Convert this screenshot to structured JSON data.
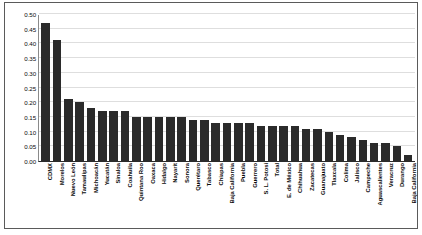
{
  "chart_data": {
    "type": "bar",
    "title": "",
    "subtitle": "",
    "xlabel": "",
    "ylabel": "",
    "ylim": [
      0.0,
      0.5
    ],
    "grid": true,
    "legend": null,
    "bar_color": "#2b2b2b",
    "background_color": "#ffffff",
    "gridline_color": "#dedede",
    "axis_color": "#2b2b2b",
    "ytick_labels": [
      "0.50",
      "0.45",
      "0.40",
      "0.35",
      "0.30",
      "0.25",
      "0.20",
      "0.15",
      "0.10",
      "0.05",
      "0.00"
    ],
    "ytick_values": [
      0.5,
      0.45,
      0.4,
      0.35,
      0.3,
      0.25,
      0.2,
      0.15,
      0.1,
      0.05,
      0.0
    ],
    "categories": [
      "CDMX",
      "Morelos",
      "Nuevo León",
      "Tamaulipas",
      "Michoacán",
      "Yucatán",
      "Sinaloa",
      "Coahuila",
      "Quintana Roo",
      "Oaxaca",
      "Hidalgo",
      "Nayarit",
      "Sonora",
      "Querétaro",
      "Tabasco",
      "Chiapas",
      "Baja California",
      "Puebla",
      "Guerrero",
      "S. L. Potosí",
      "Total",
      "E. de México",
      "Chihuahua",
      "Zacatecas",
      "Guanajuato",
      "Tlaxcala",
      "Colima",
      "Jalisco",
      "Campeche",
      "Aguascalientes",
      "Veracruz",
      "Durango",
      "Baja California"
    ],
    "values": [
      0.47,
      0.41,
      0.21,
      0.2,
      0.18,
      0.17,
      0.17,
      0.17,
      0.15,
      0.15,
      0.15,
      0.15,
      0.15,
      0.14,
      0.14,
      0.13,
      0.13,
      0.13,
      0.13,
      0.12,
      0.12,
      0.12,
      0.12,
      0.11,
      0.11,
      0.1,
      0.09,
      0.08,
      0.07,
      0.06,
      0.06,
      0.05,
      0.02
    ]
  }
}
